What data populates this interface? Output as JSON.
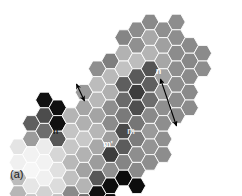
{
  "figure": {
    "panel_label": "(a)",
    "type": "self-organizing-map-hexagonal-grid",
    "background_color": "#ffffff",
    "width": 242,
    "height": 196
  },
  "annotations": {
    "node_labels": [
      {
        "id": "label-n",
        "text": "n",
        "x": 158.5,
        "y": 74.0,
        "color": "#ffffff",
        "font_size": 8.5,
        "bold": true
      },
      {
        "id": "label-n-prime",
        "text": "n'",
        "x": 56.5,
        "y": 134.0,
        "color": "#1a1a1a",
        "font_size": 8.5,
        "bold": true
      },
      {
        "id": "label-m",
        "text": "m",
        "x": 131.0,
        "y": 133.5,
        "color": "#e8e8e8",
        "font_size": 8.5,
        "bold": true
      },
      {
        "id": "label-m-prime",
        "text": "m'",
        "x": 108.0,
        "y": 146.5,
        "color": "#ffffff",
        "font_size": 8.5,
        "bold": true
      }
    ],
    "arrows": [
      {
        "id": "arrow-n-to-target",
        "x1": 160.5,
        "y1": 79.0,
        "x2": 176.5,
        "y2": 126.0,
        "color": "#000000",
        "double_headed": true,
        "width": 1.1
      },
      {
        "id": "arrow-m-short",
        "x1": 76.5,
        "y1": 84.0,
        "x2": 84.5,
        "y2": 101.0,
        "color": "#000000",
        "double_headed": true,
        "width": 1.1
      }
    ]
  },
  "grid": {
    "orientation": "flat-top-hexagon",
    "hex_width": 17.6,
    "hex_height": 15.6,
    "col_step": 13.2,
    "row_step": 15.6,
    "origin_x": 18.0,
    "origin_y": 22.0,
    "border_color": "#ffffff",
    "border_width": 0.9,
    "gray_legend": {
      "black": "#0a0a0a",
      "very_dark": "#3a3a3a",
      "dark": "#6f6f6f",
      "mid": "#8e8e8e",
      "light": "#b6b6b6",
      "very_light": "#d8d8d8",
      "near_white": "#f0f0f0"
    },
    "cells": [
      {
        "col": 9,
        "row": 0,
        "fill": "#8c8c8c"
      },
      {
        "col": 10,
        "row": 0,
        "fill": "#8a8a8a"
      },
      {
        "col": 11,
        "row": 0,
        "fill": "#8f8f8f"
      },
      {
        "col": 12,
        "row": 0,
        "fill": "#8d8d8d"
      },
      {
        "col": 8,
        "row": 1,
        "fill": "#858585"
      },
      {
        "col": 9,
        "row": 1,
        "fill": "#909090"
      },
      {
        "col": 10,
        "row": 1,
        "fill": "#a8a8a8"
      },
      {
        "col": 11,
        "row": 1,
        "fill": "#a0a0a0"
      },
      {
        "col": 12,
        "row": 1,
        "fill": "#8e8e8e"
      },
      {
        "col": 13,
        "row": 1,
        "fill": "#8a8a8a"
      },
      {
        "col": 7,
        "row": 2,
        "fill": "#7f7f7f"
      },
      {
        "col": 8,
        "row": 2,
        "fill": "#b2b2b2"
      },
      {
        "col": 9,
        "row": 2,
        "fill": "#bdbdbd"
      },
      {
        "col": 10,
        "row": 2,
        "fill": "#b4b4b4"
      },
      {
        "col": 11,
        "row": 2,
        "fill": "#a6a6a6"
      },
      {
        "col": 12,
        "row": 2,
        "fill": "#8c8c8c"
      },
      {
        "col": 13,
        "row": 2,
        "fill": "#888888"
      },
      {
        "col": 14,
        "row": 2,
        "fill": "#8b8b8b"
      },
      {
        "col": 6,
        "row": 3,
        "fill": "#8f8f8f"
      },
      {
        "col": 7,
        "row": 3,
        "fill": "#b9b9b9"
      },
      {
        "col": 8,
        "row": 3,
        "fill": "#c2c2c2"
      },
      {
        "col": 9,
        "row": 3,
        "fill": "#5a5a5a"
      },
      {
        "col": 10,
        "row": 3,
        "fill": "#545454"
      },
      {
        "col": 11,
        "row": 3,
        "fill": "#a2a2a2"
      },
      {
        "col": 12,
        "row": 3,
        "fill": "#8e8e8e"
      },
      {
        "col": 13,
        "row": 3,
        "fill": "#8a8a8a"
      },
      {
        "col": 14,
        "row": 3,
        "fill": "#8d8d8d"
      },
      {
        "col": 5,
        "row": 4,
        "fill": "#9a9a9a"
      },
      {
        "col": 6,
        "row": 4,
        "fill": "#bcbcbc"
      },
      {
        "col": 7,
        "row": 4,
        "fill": "#b0b0b0"
      },
      {
        "col": 8,
        "row": 4,
        "fill": "#5e5e5e"
      },
      {
        "col": 9,
        "row": 4,
        "fill": "#3d3d3d"
      },
      {
        "col": 10,
        "row": 4,
        "fill": "#606060"
      },
      {
        "col": 11,
        "row": 4,
        "fill": "#9c9c9c"
      },
      {
        "col": 12,
        "row": 4,
        "fill": "#8d8d8d"
      },
      {
        "col": 13,
        "row": 4,
        "fill": "#8a8a8a"
      },
      {
        "col": 2,
        "row": 5,
        "fill": "#111111"
      },
      {
        "col": 3,
        "row": 5,
        "fill": "#101010"
      },
      {
        "col": 5,
        "row": 5,
        "fill": "#a5a5a5"
      },
      {
        "col": 6,
        "row": 5,
        "fill": "#b8b8b8"
      },
      {
        "col": 7,
        "row": 5,
        "fill": "#8e8e8e"
      },
      {
        "col": 8,
        "row": 5,
        "fill": "#6a6a6a"
      },
      {
        "col": 9,
        "row": 5,
        "fill": "#4e4e4e"
      },
      {
        "col": 10,
        "row": 5,
        "fill": "#6d6d6d"
      },
      {
        "col": 11,
        "row": 5,
        "fill": "#8f8f8f"
      },
      {
        "col": 12,
        "row": 5,
        "fill": "#8c8c8c"
      },
      {
        "col": 13,
        "row": 5,
        "fill": "#8b8b8b"
      },
      {
        "col": 1,
        "row": 6,
        "fill": "#5f5f5f"
      },
      {
        "col": 2,
        "row": 6,
        "fill": "#4c4c4c"
      },
      {
        "col": 3,
        "row": 6,
        "fill": "#111111"
      },
      {
        "col": 4,
        "row": 6,
        "fill": "#b4b4b4"
      },
      {
        "col": 5,
        "row": 6,
        "fill": "#b0b0b0"
      },
      {
        "col": 6,
        "row": 6,
        "fill": "#a4a4a4"
      },
      {
        "col": 7,
        "row": 6,
        "fill": "#8b8b8b"
      },
      {
        "col": 8,
        "row": 6,
        "fill": "#7a7a7a"
      },
      {
        "col": 9,
        "row": 6,
        "fill": "#767676"
      },
      {
        "col": 10,
        "row": 6,
        "fill": "#8a8a8a"
      },
      {
        "col": 11,
        "row": 6,
        "fill": "#8e8e8e"
      },
      {
        "col": 12,
        "row": 6,
        "fill": "#8c8c8c"
      },
      {
        "col": 1,
        "row": 7,
        "fill": "#9c9c9c"
      },
      {
        "col": 2,
        "row": 7,
        "fill": "#6e6e6e"
      },
      {
        "col": 3,
        "row": 7,
        "fill": "#575757"
      },
      {
        "col": 4,
        "row": 7,
        "fill": "#c4c4c4"
      },
      {
        "col": 5,
        "row": 7,
        "fill": "#c8c8c8"
      },
      {
        "col": 6,
        "row": 7,
        "fill": "#b6b6b6"
      },
      {
        "col": 7,
        "row": 7,
        "fill": "#9d9d9d"
      },
      {
        "col": 8,
        "row": 7,
        "fill": "#4a4a4a"
      },
      {
        "col": 9,
        "row": 7,
        "fill": "#7c7c7c"
      },
      {
        "col": 10,
        "row": 7,
        "fill": "#9a9a9a"
      },
      {
        "col": 11,
        "row": 7,
        "fill": "#909090"
      },
      {
        "col": 0,
        "row": 8,
        "fill": "#e4e4e4"
      },
      {
        "col": 1,
        "row": 8,
        "fill": "#f2f2f2"
      },
      {
        "col": 2,
        "row": 8,
        "fill": "#ececec"
      },
      {
        "col": 3,
        "row": 8,
        "fill": "#d6d6d6"
      },
      {
        "col": 4,
        "row": 8,
        "fill": "#c6c6c6"
      },
      {
        "col": 5,
        "row": 8,
        "fill": "#b2b2b2"
      },
      {
        "col": 6,
        "row": 8,
        "fill": "#a8a8a8"
      },
      {
        "col": 7,
        "row": 8,
        "fill": "#3e3e3e"
      },
      {
        "col": 8,
        "row": 8,
        "fill": "#5c5c5c"
      },
      {
        "col": 9,
        "row": 8,
        "fill": "#8e8e8e"
      },
      {
        "col": 10,
        "row": 8,
        "fill": "#949494"
      },
      {
        "col": 11,
        "row": 8,
        "fill": "#8d8d8d"
      },
      {
        "col": 0,
        "row": 9,
        "fill": "#f0f0f0"
      },
      {
        "col": 1,
        "row": 9,
        "fill": "#f6f6f6"
      },
      {
        "col": 2,
        "row": 9,
        "fill": "#f2f2f2"
      },
      {
        "col": 3,
        "row": 9,
        "fill": "#e0e0e0"
      },
      {
        "col": 4,
        "row": 9,
        "fill": "#b8b8b8"
      },
      {
        "col": 5,
        "row": 9,
        "fill": "#a2a2a2"
      },
      {
        "col": 6,
        "row": 9,
        "fill": "#9c9c9c"
      },
      {
        "col": 7,
        "row": 9,
        "fill": "#909090"
      },
      {
        "col": 8,
        "row": 9,
        "fill": "#858585"
      },
      {
        "col": 9,
        "row": 9,
        "fill": "#8a8a8a"
      },
      {
        "col": 10,
        "row": 9,
        "fill": "#8e8e8e"
      },
      {
        "col": 0,
        "row": 10,
        "fill": "#bcbcbc"
      },
      {
        "col": 1,
        "row": 10,
        "fill": "#e6e6e6"
      },
      {
        "col": 2,
        "row": 10,
        "fill": "#f0f0f0"
      },
      {
        "col": 3,
        "row": 10,
        "fill": "#dcdcdc"
      },
      {
        "col": 4,
        "row": 10,
        "fill": "#c0c0c0"
      },
      {
        "col": 5,
        "row": 10,
        "fill": "#b4b4b4"
      },
      {
        "col": 6,
        "row": 10,
        "fill": "#585858"
      },
      {
        "col": 7,
        "row": 10,
        "fill": "#0e0e0e"
      },
      {
        "col": 8,
        "row": 10,
        "fill": "#0c0c0c"
      },
      {
        "col": 9,
        "row": 10,
        "fill": "#0d0d0d"
      },
      {
        "col": 0,
        "row": 11,
        "fill": "#b6b6b6"
      },
      {
        "col": 1,
        "row": 11,
        "fill": "#c8c8c8"
      },
      {
        "col": 2,
        "row": 11,
        "fill": "#d2d2d2"
      },
      {
        "col": 3,
        "row": 11,
        "fill": "#c2c2c2"
      },
      {
        "col": 4,
        "row": 11,
        "fill": "#8a8a8a"
      },
      {
        "col": 5,
        "row": 11,
        "fill": "#6e6e6e"
      },
      {
        "col": 6,
        "row": 11,
        "fill": "#0f0f0f"
      },
      {
        "col": 7,
        "row": 11,
        "fill": "#0c0c0c"
      },
      {
        "col": 4,
        "row": 12,
        "fill": "#0e0e0e"
      },
      {
        "col": 5,
        "row": 12,
        "fill": "#0d0d0d"
      }
    ]
  }
}
